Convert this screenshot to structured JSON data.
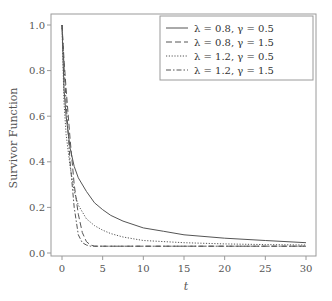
{
  "chart_data": {
    "type": "line",
    "title": "",
    "xlabel": "t",
    "ylabel": "Survivor Function",
    "xlim": [
      -1.2,
      31
    ],
    "ylim": [
      -0.02,
      1.05
    ],
    "xticks": [
      0,
      5,
      10,
      15,
      20,
      25,
      30
    ],
    "yticks": [
      0.0,
      0.2,
      0.4,
      0.6,
      0.8,
      1.0
    ],
    "ytick_labels": [
      "0.0",
      "0.2",
      "0.4",
      "0.6",
      "0.8",
      "1.0"
    ],
    "grid": false,
    "legend_position": "upper right",
    "series": [
      {
        "name": "λ = 0.8, γ = 0.5",
        "style": "solid",
        "x": [
          0,
          0.25,
          0.5,
          1,
          1.5,
          2,
          3,
          4,
          5,
          6,
          7.5,
          10,
          12.5,
          15,
          20,
          25,
          30
        ],
        "y": [
          1.0,
          0.72,
          0.6,
          0.46,
          0.38,
          0.33,
          0.27,
          0.22,
          0.19,
          0.165,
          0.14,
          0.11,
          0.095,
          0.08,
          0.065,
          0.055,
          0.045
        ]
      },
      {
        "name": "λ = 0.8, γ = 1.5",
        "style": "dashed",
        "x": [
          0,
          0.25,
          0.5,
          1,
          1.5,
          2,
          2.5,
          3,
          3.5,
          4,
          5,
          10,
          15,
          20,
          25,
          30
        ],
        "y": [
          1.0,
          0.85,
          0.72,
          0.5,
          0.3,
          0.17,
          0.09,
          0.05,
          0.035,
          0.03,
          0.03,
          0.03,
          0.03,
          0.03,
          0.03,
          0.03
        ]
      },
      {
        "name": "λ = 1.2, γ = 0.5",
        "style": "dotted",
        "x": [
          0,
          0.25,
          0.5,
          1,
          1.5,
          2,
          3,
          4,
          5,
          6,
          7.5,
          10,
          12.5,
          15,
          20,
          25,
          30
        ],
        "y": [
          1.0,
          0.66,
          0.52,
          0.38,
          0.27,
          0.21,
          0.15,
          0.12,
          0.1,
          0.085,
          0.07,
          0.055,
          0.05,
          0.045,
          0.04,
          0.037,
          0.035
        ]
      },
      {
        "name": "λ = 1.2, γ = 1.5",
        "style": "dashdot",
        "x": [
          0,
          0.25,
          0.5,
          1,
          1.5,
          2,
          2.5,
          3,
          3.5,
          4,
          5,
          10,
          15,
          20,
          25,
          30
        ],
        "y": [
          1.0,
          0.82,
          0.66,
          0.4,
          0.2,
          0.08,
          0.045,
          0.035,
          0.03,
          0.03,
          0.03,
          0.03,
          0.03,
          0.03,
          0.03,
          0.03
        ]
      }
    ]
  },
  "colors": {
    "axis": "#888888",
    "line": "#555555",
    "legend_border": "#888888"
  }
}
